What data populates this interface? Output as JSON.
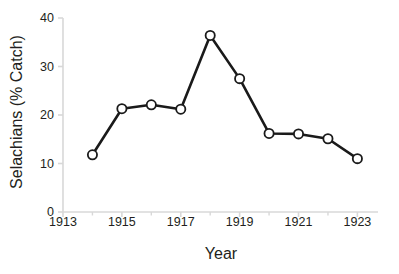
{
  "chart_data": {
    "type": "line",
    "title": "",
    "xlabel": "Year",
    "ylabel": "Selachians (% Catch)",
    "xlim": [
      1913,
      1923.7
    ],
    "ylim": [
      0,
      40
    ],
    "grid": false,
    "legend": false,
    "marker": "open-circle",
    "line_color": "#1a1a1a",
    "marker_fill": "#ffffff",
    "marker_edge": "#1a1a1a",
    "axis_color": "#d8d8d8",
    "text_color": "#231f20",
    "x": [
      1914,
      1915,
      1916,
      1917,
      1918,
      1919,
      1920,
      1921,
      1922,
      1923
    ],
    "values": [
      11.8,
      21.3,
      22.1,
      21.2,
      36.4,
      27.5,
      16.2,
      16.1,
      15.1,
      11.0
    ],
    "series": [
      {
        "name": "Selachians",
        "x": [
          1914,
          1915,
          1916,
          1917,
          1918,
          1919,
          1920,
          1921,
          1922,
          1923
        ],
        "values": [
          11.8,
          21.3,
          22.1,
          21.2,
          36.4,
          27.5,
          16.2,
          16.1,
          15.1,
          11.0
        ]
      }
    ],
    "x_ticks_major": [
      1913,
      1915,
      1917,
      1919,
      1921,
      1923
    ],
    "x_tick_labels": [
      "1913",
      "1915",
      "1917",
      "1919",
      "1921",
      "1923"
    ],
    "x_ticks_minor": [
      1914,
      1916,
      1918,
      1920,
      1922
    ],
    "y_ticks": [
      0,
      10,
      20,
      30,
      40
    ],
    "y_tick_labels": [
      "0",
      "10",
      "20",
      "30",
      "40"
    ]
  }
}
